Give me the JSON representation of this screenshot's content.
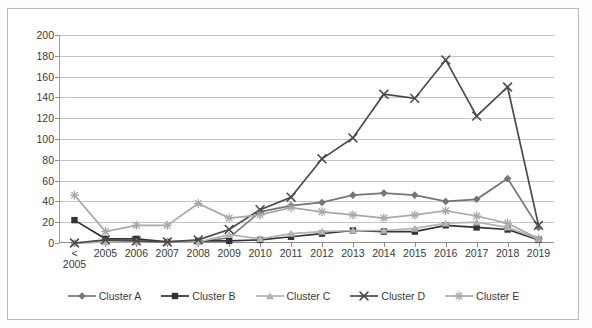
{
  "chart_data": {
    "type": "line",
    "title": "",
    "xlabel": "",
    "ylabel": "",
    "ylim": [
      0,
      200
    ],
    "ystep": 20,
    "grid": true,
    "legend_position": "bottom",
    "categories": [
      "< 2005",
      "2005",
      "2006",
      "2007",
      "2008",
      "2009",
      "2010",
      "2011",
      "2012",
      "2013",
      "2014",
      "2015",
      "2016",
      "2017",
      "2018",
      "2019"
    ],
    "ytick_labels": [
      "0",
      "20",
      "40",
      "60",
      "80",
      "100",
      "120",
      "140",
      "160",
      "180",
      "200"
    ],
    "series": [
      {
        "name": "Cluster A",
        "marker": "diamond",
        "color": "#757575",
        "values": [
          0,
          1,
          1,
          1,
          1,
          5,
          30,
          36,
          39,
          46,
          48,
          46,
          40,
          42,
          62,
          15
        ]
      },
      {
        "name": "Cluster B",
        "marker": "square",
        "color": "#333333",
        "values": [
          22,
          4,
          4,
          1,
          2,
          2,
          3,
          6,
          9,
          12,
          11,
          11,
          17,
          15,
          13,
          3
        ]
      },
      {
        "name": "Cluster C",
        "marker": "triangle",
        "color": "#b3b3b3",
        "values": [
          0,
          1,
          1,
          1,
          1,
          8,
          4,
          9,
          11,
          12,
          12,
          14,
          19,
          20,
          15,
          4
        ]
      },
      {
        "name": "Cluster D",
        "marker": "x",
        "color": "#4a4a4a",
        "values": [
          0,
          3,
          2,
          1,
          3,
          13,
          32,
          44,
          81,
          101,
          143,
          139,
          176,
          122,
          150,
          17
        ]
      },
      {
        "name": "Cluster E",
        "marker": "star",
        "color": "#a8a8a8",
        "values": [
          46,
          11,
          17,
          17,
          38,
          24,
          27,
          34,
          30,
          27,
          24,
          27,
          31,
          26,
          19,
          4
        ]
      }
    ]
  },
  "legend": {
    "items": [
      {
        "label": "Cluster A"
      },
      {
        "label": "Cluster B"
      },
      {
        "label": "Cluster C"
      },
      {
        "label": "Cluster D"
      },
      {
        "label": "Cluster E"
      }
    ]
  }
}
